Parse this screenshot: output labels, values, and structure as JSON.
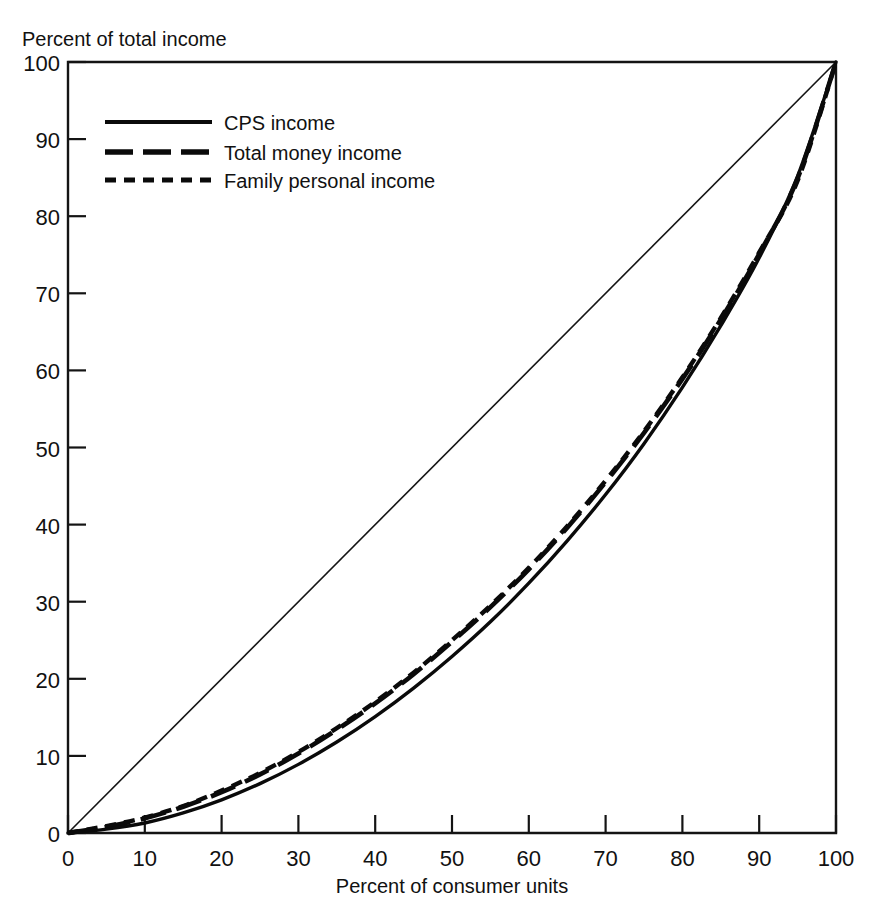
{
  "chart_data": {
    "type": "line",
    "title": "",
    "xlabel": "Percent of consumer units",
    "ylabel": "Percent of total income",
    "xlim": [
      0,
      100
    ],
    "ylim": [
      0,
      100
    ],
    "grid": false,
    "legend_position": "upper-left-inside",
    "x_ticks": [
      "0",
      "10",
      "20",
      "30",
      "40",
      "50",
      "60",
      "70",
      "80",
      "90",
      "100"
    ],
    "y_ticks": [
      "0",
      "10",
      "20",
      "30",
      "40",
      "50",
      "60",
      "70",
      "80",
      "90",
      "100"
    ],
    "x": [
      0,
      5,
      10,
      15,
      20,
      25,
      30,
      35,
      40,
      45,
      50,
      55,
      60,
      65,
      70,
      75,
      80,
      85,
      90,
      95,
      100
    ],
    "series": [
      {
        "name": "CPS income",
        "style": "solid",
        "values": [
          0.0,
          0.5,
          1.3,
          2.6,
          4.3,
          6.4,
          8.9,
          11.8,
          15.1,
          18.8,
          22.9,
          27.4,
          32.4,
          37.9,
          43.9,
          50.5,
          57.8,
          65.8,
          74.6,
          85.2,
          100.0
        ]
      },
      {
        "name": "Total money income",
        "style": "long-dash",
        "values": [
          0.0,
          0.8,
          1.9,
          3.4,
          5.3,
          7.6,
          10.3,
          13.4,
          16.8,
          20.6,
          24.8,
          29.3,
          34.2,
          39.6,
          45.5,
          51.9,
          58.9,
          66.6,
          75.1,
          84.9,
          100.0
        ]
      },
      {
        "name": "Family personal income",
        "style": "short-dash",
        "values": [
          0.0,
          0.9,
          2.0,
          3.5,
          5.5,
          7.8,
          10.5,
          13.6,
          17.0,
          20.8,
          25.0,
          29.5,
          34.4,
          39.8,
          45.7,
          52.1,
          59.1,
          66.8,
          75.3,
          84.6,
          100.0
        ]
      }
    ],
    "reference_line": {
      "name": "line-of-equality",
      "style": "thin-solid",
      "from": [
        0,
        0
      ],
      "to": [
        100,
        100
      ]
    }
  },
  "legend": {
    "items": [
      {
        "label": "CPS income",
        "style": "solid"
      },
      {
        "label": "Total money income",
        "style": "long-dash"
      },
      {
        "label": "Family personal income",
        "style": "short-dash"
      }
    ]
  },
  "colors": {
    "ink": "#0a0a0a",
    "frame": "#141414",
    "background": "#ffffff"
  }
}
